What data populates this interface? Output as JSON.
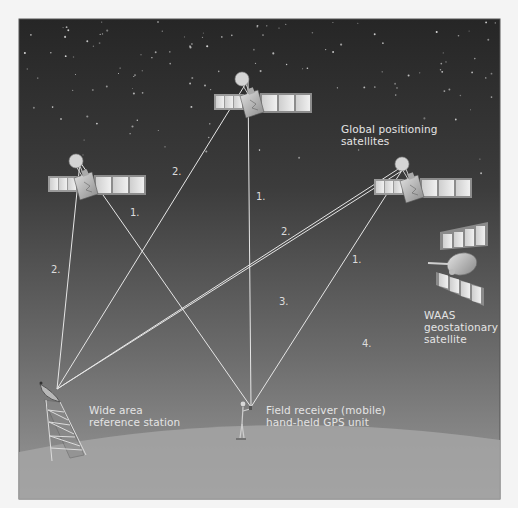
{
  "diagram": {
    "colors": {
      "sky_top": "#2a2a2a",
      "sky_bottom": "#8e8e8e",
      "ground": "#a3a3a3",
      "signal_line": "#e8e8e8",
      "label_text": "#e4e4e4",
      "page_bg": "#f4f4f4"
    },
    "labels": {
      "gps_satellites": "Global positioning\nsatellites",
      "waas_satellite": "WAAS\ngeostationary\nsatellite",
      "reference_station": "Wide area\nreference station",
      "field_receiver": "Field receiver (mobile)\nhand-held GPS unit"
    },
    "nodes": {
      "satellite_top": {
        "x": 248,
        "y": 80,
        "name": "GPS satellite (top)"
      },
      "satellite_left": {
        "x": 80,
        "y": 162,
        "name": "GPS satellite (left)"
      },
      "satellite_right": {
        "x": 406,
        "y": 164,
        "name": "GPS satellite (right)"
      },
      "waas_satellite": {
        "x": 460,
        "y": 265,
        "name": "WAAS geostationary satellite"
      },
      "reference_station": {
        "x": 57,
        "y": 389,
        "name": "Wide area reference station"
      },
      "field_receiver": {
        "x": 251,
        "y": 407,
        "name": "Field receiver"
      }
    },
    "signal_lines": [
      {
        "from": "satellite_left",
        "to": "field_receiver",
        "label": "1."
      },
      {
        "from": "satellite_top",
        "to": "field_receiver",
        "label": "1."
      },
      {
        "from": "satellite_right",
        "to": "field_receiver",
        "label": "1."
      },
      {
        "from": "satellite_left",
        "to": "reference_station",
        "label": "2."
      },
      {
        "from": "satellite_top",
        "to": "reference_station",
        "label": "2."
      },
      {
        "from": "satellite_right",
        "to": "reference_station",
        "label": "2."
      }
    ],
    "step_numbers": [
      {
        "id": "left-sat-to-receiver",
        "text": "1.",
        "x": 130,
        "y": 207
      },
      {
        "id": "top-sat-to-receiver",
        "text": "1.",
        "x": 256,
        "y": 191
      },
      {
        "id": "right-sat-to-receiver",
        "text": "1.",
        "x": 352,
        "y": 254
      },
      {
        "id": "top-sat-to-station",
        "text": "2.",
        "x": 172,
        "y": 166
      },
      {
        "id": "left-sat-to-station",
        "text": "2.",
        "x": 51,
        "y": 264
      },
      {
        "id": "right-sat-to-station",
        "text": "2.",
        "x": 281,
        "y": 226
      },
      {
        "id": "station-to-waas",
        "text": "3.",
        "x": 279,
        "y": 296
      },
      {
        "id": "waas-to-receiver",
        "text": "4.",
        "x": 362,
        "y": 338
      }
    ]
  }
}
